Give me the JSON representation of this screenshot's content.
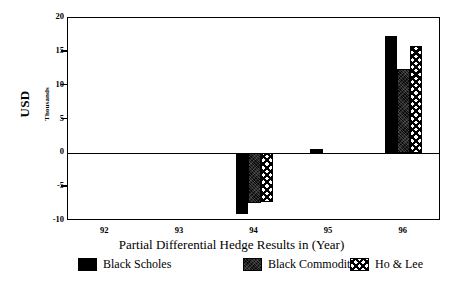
{
  "chart_data": {
    "type": "bar",
    "title": "",
    "xlabel": "Partial Differential Hedge Results in (Year)",
    "ylabel": "USD",
    "ylabel_secondary": "Thousands",
    "categories": [
      "92",
      "93",
      "94",
      "95",
      "96"
    ],
    "ylim": [
      -10,
      20
    ],
    "yticks": [
      20,
      15,
      10,
      5,
      0,
      -5,
      -10
    ],
    "ytick_labels": [
      "20",
      "15",
      "10",
      "5",
      "0",
      "-5",
      "-10"
    ],
    "grid": false,
    "legend_position": "bottom",
    "series": [
      {
        "name": "Black Scholes",
        "pattern": "solid-black",
        "color": "#000000",
        "values": [
          0,
          0,
          -8.9,
          0.7,
          17.4
        ]
      },
      {
        "name": "Black Commodity",
        "pattern": "dark-textured",
        "color": "#0a0a0a",
        "values": [
          0,
          0,
          -7.3,
          0,
          12.4
        ]
      },
      {
        "name": "Ho & Lee",
        "pattern": "cross-hatch",
        "color": "#000000",
        "values": [
          0,
          0,
          -7.2,
          0,
          15.9
        ]
      }
    ]
  },
  "axis": {
    "y_title": "USD",
    "y_subtitle": "Thousands",
    "x_title": "Partial Differential Hedge Results in (Year)"
  },
  "legend": {
    "entries": [
      {
        "label": "Black Scholes"
      },
      {
        "label": "Black Commodity"
      },
      {
        "label": "Ho & Lee"
      }
    ]
  }
}
